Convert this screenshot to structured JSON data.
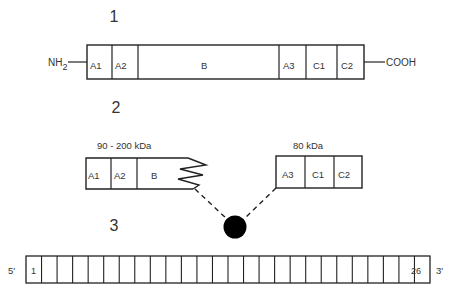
{
  "panel1": {
    "number": "1",
    "n_terminus": "NH",
    "n_terminus_sub": "2",
    "c_terminus": "COOH",
    "domains": [
      "A1",
      "A2",
      "B",
      "A3",
      "C1",
      "C2"
    ]
  },
  "panel2": {
    "number": "2",
    "heavy_chain": {
      "mass": "90 - 200 kDa",
      "domains": [
        "A1",
        "A2",
        "B"
      ]
    },
    "light_chain": {
      "mass": "80 kDa",
      "domains": [
        "A3",
        "C1",
        "C2"
      ]
    },
    "linker": "metal-ion"
  },
  "panel3": {
    "number": "3",
    "five_prime": "5'",
    "three_prime": "3'",
    "first_exon": "1",
    "last_exon": "26",
    "exon_count": 26
  }
}
